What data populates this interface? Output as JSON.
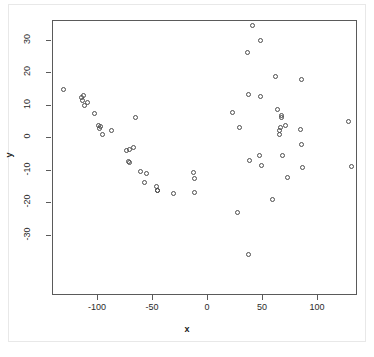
{
  "figure": {
    "background_color": "#ffffff",
    "frame_color": "#e8e8e8",
    "axis_color": "#5a5a5a",
    "point_color": "#4d4d4d"
  },
  "chart_data": {
    "type": "scatter",
    "title": "",
    "xlabel": "x",
    "ylabel": "y",
    "xlim": [
      -145,
      132
    ],
    "ylim": [
      -38,
      38
    ],
    "xticks": [
      -100,
      -50,
      0,
      50,
      100
    ],
    "yticks": [
      -30,
      -20,
      -10,
      0,
      10,
      20,
      30
    ],
    "xticklabels": [
      "-100",
      "-50",
      "0",
      "50",
      "100"
    ],
    "yticklabels": [
      "-30",
      "-20",
      "-10",
      "0",
      "10",
      "20",
      "30"
    ],
    "grid": false,
    "legend": false,
    "marker": "open-circle",
    "marker_size": 5,
    "n_points": 61,
    "points": [
      {
        "x": -131,
        "y": 14.8
      },
      {
        "x": -115,
        "y": 12.4
      },
      {
        "x": -114,
        "y": 11.6
      },
      {
        "x": -113,
        "y": 13.0
      },
      {
        "x": -112,
        "y": 10.0
      },
      {
        "x": -110,
        "y": 10.9
      },
      {
        "x": -103,
        "y": 7.6
      },
      {
        "x": -100,
        "y": 4.0
      },
      {
        "x": -99,
        "y": 3.0
      },
      {
        "x": -98,
        "y": 3.6
      },
      {
        "x": -96,
        "y": 1.2
      },
      {
        "x": -88,
        "y": 2.2
      },
      {
        "x": -74,
        "y": -3.8
      },
      {
        "x": -72,
        "y": -7.3
      },
      {
        "x": -71,
        "y": -7.5
      },
      {
        "x": -71,
        "y": -3.4
      },
      {
        "x": -68,
        "y": -3.0
      },
      {
        "x": -66,
        "y": 6.4
      },
      {
        "x": -61,
        "y": -10.4
      },
      {
        "x": -58,
        "y": -13.7
      },
      {
        "x": -56,
        "y": -11.0
      },
      {
        "x": -47,
        "y": -14.9
      },
      {
        "x": -46,
        "y": -16.0
      },
      {
        "x": -46,
        "y": -16.3
      },
      {
        "x": -31,
        "y": -17.1
      },
      {
        "x": -13,
        "y": -10.6
      },
      {
        "x": -12,
        "y": -12.6
      },
      {
        "x": -12,
        "y": -16.7
      },
      {
        "x": 22,
        "y": 7.9
      },
      {
        "x": 27,
        "y": -22.9
      },
      {
        "x": 29,
        "y": 3.2
      },
      {
        "x": 36,
        "y": 26.2
      },
      {
        "x": 37,
        "y": 13.5
      },
      {
        "x": 37,
        "y": -35.7
      },
      {
        "x": 38,
        "y": -7.0
      },
      {
        "x": 40,
        "y": 34.6
      },
      {
        "x": 47,
        "y": -5.3
      },
      {
        "x": 48,
        "y": 12.8
      },
      {
        "x": 48,
        "y": 29.9
      },
      {
        "x": 49,
        "y": -8.5
      },
      {
        "x": 59,
        "y": -18.9
      },
      {
        "x": 61,
        "y": 18.8
      },
      {
        "x": 63,
        "y": 8.8
      },
      {
        "x": 65,
        "y": 2.3
      },
      {
        "x": 65,
        "y": 1.2
      },
      {
        "x": 66,
        "y": 3.2
      },
      {
        "x": 67,
        "y": 6.2
      },
      {
        "x": 67,
        "y": 7.0
      },
      {
        "x": 68,
        "y": -5.3
      },
      {
        "x": 70,
        "y": 3.7
      },
      {
        "x": 72,
        "y": -12.2
      },
      {
        "x": 84,
        "y": 2.5
      },
      {
        "x": 85,
        "y": -2.0
      },
      {
        "x": 85,
        "y": 18.1
      },
      {
        "x": 86,
        "y": -9.1
      },
      {
        "x": 128,
        "y": 5.0
      },
      {
        "x": 130,
        "y": -8.9
      }
    ]
  }
}
